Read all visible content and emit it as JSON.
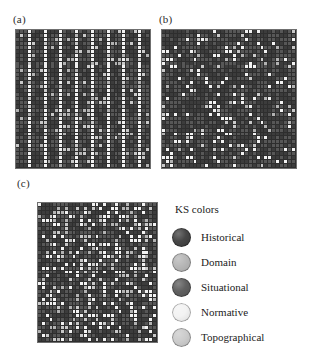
{
  "figure": {
    "panels": [
      {
        "id": "a",
        "label": "(a)",
        "pattern": "vertical-stripes"
      },
      {
        "id": "b",
        "label": "(b)",
        "pattern": "sparse-random"
      },
      {
        "id": "c",
        "label": "(c)",
        "pattern": "dense-mixed"
      }
    ]
  },
  "legend": {
    "title": "KS colors",
    "entries": [
      {
        "label": "Historical",
        "color": "#3c3c3c"
      },
      {
        "label": "Domain",
        "color": "#b3b3b3"
      },
      {
        "label": "Situational",
        "color": "#575757"
      },
      {
        "label": "Normative",
        "color": "#f2f2f2"
      },
      {
        "label": "Topographical",
        "color": "#c9c9c9"
      }
    ]
  },
  "chart_data": {
    "type": "heatmap",
    "title": "KS colors",
    "xlabel": "",
    "ylabel": "",
    "grid": true,
    "legend_position": "right",
    "categories": [
      "Historical",
      "Domain",
      "Situational",
      "Normative",
      "Topographical"
    ],
    "category_colors": [
      "#3c3c3c",
      "#b3b3b3",
      "#575757",
      "#f2f2f2",
      "#c9c9c9"
    ],
    "panels": [
      {
        "id": "a",
        "label": "(a)",
        "description": "Regular vertical stripes of light knowledge-source cells on a dark background",
        "cols": 34,
        "rows": 35,
        "background": "#2e2e2e",
        "generator": {
          "mode": "stripes",
          "period": 4,
          "phase": 1,
          "seed": 11,
          "light_share": 0.26,
          "mid_share": 0.1
        }
      },
      {
        "id": "b",
        "label": "(b)",
        "description": "Sparse randomly scattered light cells on a dark background",
        "cols": 34,
        "rows": 35,
        "background": "#2e2e2e",
        "generator": {
          "mode": "sparse",
          "density": 0.11,
          "seed": 29,
          "light_share": 0.11,
          "mid_share": 0.07
        }
      },
      {
        "id": "c",
        "label": "(c)",
        "description": "Dense mixed scatter of light and mid-tone cells on a dark background",
        "cols": 31,
        "rows": 35,
        "background": "#2e2e2e",
        "generator": {
          "mode": "dense",
          "density": 0.3,
          "seed": 53,
          "light_share": 0.17,
          "mid_share": 0.15
        }
      }
    ]
  }
}
